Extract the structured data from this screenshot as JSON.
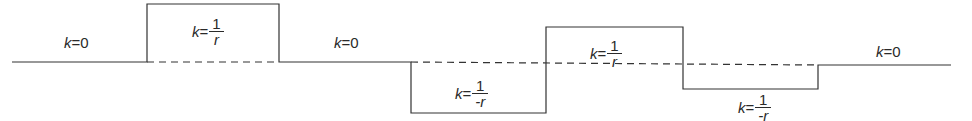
{
  "diagram": {
    "stroke_color": "#333333",
    "segments": [
      {
        "id": "seg1",
        "label_k": "k",
        "label_eq": "=",
        "value": "0",
        "type": "zero"
      },
      {
        "id": "seg2",
        "label_k": "k",
        "label_eq": "=",
        "num": "1",
        "den": "r",
        "type": "positive"
      },
      {
        "id": "seg3",
        "label_k": "k",
        "label_eq": "=",
        "value": "0",
        "type": "zero"
      },
      {
        "id": "seg4",
        "label_k": "k",
        "label_eq": "=",
        "num": "1",
        "den": "-r",
        "type": "negative"
      },
      {
        "id": "seg5",
        "label_k": "k",
        "label_eq": "=",
        "num": "1",
        "den": "r",
        "type": "positive"
      },
      {
        "id": "seg6",
        "label_k": "k",
        "label_eq": "=",
        "num": "1",
        "den": "-r",
        "type": "negative"
      },
      {
        "id": "seg7",
        "label_k": "k",
        "label_eq": "=",
        "value": "0",
        "type": "zero"
      }
    ]
  }
}
